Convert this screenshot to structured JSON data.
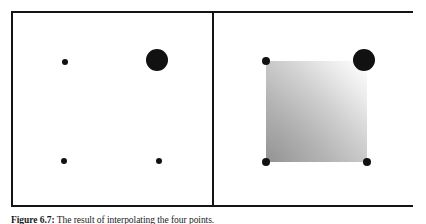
{
  "figure": {
    "caption_label": "Figure 6.7:",
    "caption_text": " The result of interpolating the four points.",
    "frame": {
      "border_color": "#141414",
      "background_color": "#ffffff",
      "border_width_px": 2
    },
    "panels": [
      {
        "id": "left",
        "name": "input-points-panel",
        "description": "Four scattered black control points on a white background",
        "points": [
          {
            "name": "point-top-left",
            "cx": 52,
            "cy": 49,
            "r": 3,
            "color": "#111111"
          },
          {
            "name": "point-top-right",
            "cx": 144,
            "cy": 47,
            "r": 11,
            "color": "#111111"
          },
          {
            "name": "point-bottom-left",
            "cx": 51,
            "cy": 148,
            "r": 3,
            "color": "#111111"
          },
          {
            "name": "point-bottom-right",
            "cx": 146,
            "cy": 148,
            "r": 3,
            "color": "#111111"
          }
        ]
      },
      {
        "id": "right",
        "name": "interpolated-surface-panel",
        "description": "The same four points with a smoothly shaded quadrilateral interpolated between them",
        "surface": {
          "name": "interpolated-quad",
          "corners": [
            {
              "x": 52,
              "y": 48
            },
            {
              "x": 153,
              "y": 48
            },
            {
              "x": 153,
              "y": 149
            },
            {
              "x": 52,
              "y": 149
            }
          ],
          "shading": {
            "darkest_corner": "bottom-left",
            "lightest_corner": "top-right",
            "dark_value": "#999999",
            "light_value": "#ffffff"
          }
        },
        "points": [
          {
            "name": "point-top-left",
            "cx": 52,
            "cy": 48,
            "r": 4,
            "color": "#111111"
          },
          {
            "name": "point-top-right",
            "cx": 150,
            "cy": 47,
            "r": 11,
            "color": "#111111"
          },
          {
            "name": "point-bottom-left",
            "cx": 52,
            "cy": 149,
            "r": 4,
            "color": "#111111"
          },
          {
            "name": "point-bottom-right",
            "cx": 153,
            "cy": 149,
            "r": 4,
            "color": "#111111"
          }
        ]
      }
    ]
  }
}
